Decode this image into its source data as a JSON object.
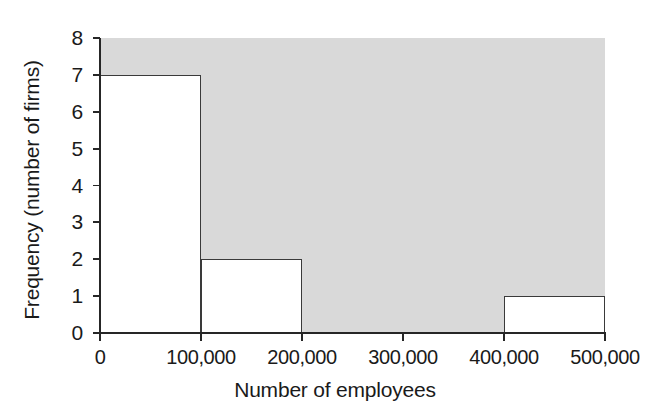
{
  "chart_data": {
    "type": "bar",
    "title": "",
    "subtitle": "",
    "xlabel": "Number of employees",
    "ylabel": "Frequency (number of firms)",
    "categories": [
      "0-100,000",
      "100,000-200,000",
      "200,000-300,000",
      "300,000-400,000",
      "400,000-500,000"
    ],
    "bin_edges": [
      0,
      100000,
      200000,
      300000,
      400000,
      500000
    ],
    "values": [
      7,
      2,
      0,
      0,
      1
    ],
    "xlim": [
      0,
      500000
    ],
    "ylim": [
      0,
      8
    ],
    "xticks": [
      0,
      100000,
      200000,
      300000,
      400000,
      500000
    ],
    "xtick_labels": [
      "0",
      "100,000",
      "200,000",
      "300,000",
      "400,000",
      "500,000"
    ],
    "yticks": [
      0,
      1,
      2,
      3,
      4,
      5,
      6,
      7,
      8
    ],
    "ytick_labels": [
      "0",
      "1",
      "2",
      "3",
      "4",
      "5",
      "6",
      "7",
      "8"
    ],
    "grid": false,
    "legend": false,
    "legend_position": "none",
    "annotations": [],
    "colors": {
      "plot_background": "#d9d9d9",
      "bar_fill": "#ffffff",
      "bar_outline": "#3a3a3a",
      "axis": "#262626",
      "text": "#1a1a1a"
    }
  }
}
